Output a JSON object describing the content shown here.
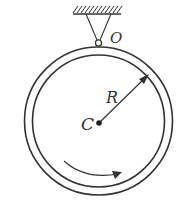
{
  "diagram": {
    "type": "physics-mechanics",
    "colors": {
      "stroke": "#333333",
      "background": "#ffffff"
    },
    "labels": {
      "pivot": "O",
      "center": "C",
      "radius": "R"
    },
    "elements": {
      "ceiling": "fixed support with hatching",
      "pivot": "small hinge circle at top of ring",
      "ring": "double-line circular ring",
      "radius_arrow": "arrow from center C to ring",
      "rotation_arrow": "curved arrow at bottom indicating rotation direction"
    }
  }
}
